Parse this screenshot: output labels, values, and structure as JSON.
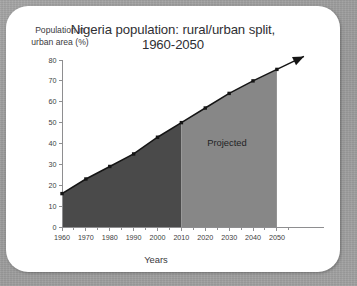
{
  "figure": {
    "title_line1": "Nigeria population: rural/urban split,",
    "title_line2": "1960-2050",
    "ylabel_line1": "Population in",
    "ylabel_line2": "urban area (%)",
    "xlabel": "Years",
    "annotation": "Projected",
    "colors": {
      "page_background": "#9e9e9e",
      "card_background": "#ffffff",
      "historical_fill": "#4a4a4a",
      "projected_fill": "#878787",
      "line": "#151515",
      "axis": "#8e8e90",
      "text": "#37373a"
    }
  },
  "chart_data": {
    "type": "area",
    "title": "Nigeria population: rural/urban split, 1960-2050",
    "xlabel": "Years",
    "ylabel": "Population in urban area (%)",
    "xlim": [
      1960,
      2058
    ],
    "ylim": [
      0,
      80
    ],
    "grid": false,
    "legend": false,
    "annotations": [
      {
        "text": "Projected",
        "x": 2030,
        "y": 40
      }
    ],
    "x": [
      1960,
      1970,
      1980,
      1990,
      2000,
      2010,
      2020,
      2030,
      2040,
      2050
    ],
    "values": [
      16,
      23,
      29,
      35,
      43,
      50,
      57,
      64,
      70,
      75.5
    ],
    "series": [
      {
        "name": "Urban population share (%)",
        "values": [
          16,
          23,
          29,
          35,
          43,
          50,
          57,
          64,
          70,
          75.5
        ]
      }
    ],
    "segments": [
      {
        "name": "Historical",
        "x_start": 1960,
        "x_end": 2010,
        "fill": "#4a4a4a"
      },
      {
        "name": "Projected",
        "x_start": 2010,
        "x_end": 2050,
        "fill": "#878787"
      }
    ],
    "xticks": [
      1960,
      1970,
      1980,
      1990,
      2000,
      2010,
      2020,
      2030,
      2040,
      2050
    ],
    "xtick_labels": [
      "1960",
      "1970",
      "1980",
      "1990",
      "2000",
      "2010",
      "2020",
      "2030",
      "2040",
      "2050"
    ],
    "yticks": [
      0,
      10,
      20,
      30,
      40,
      50,
      60,
      70,
      80
    ],
    "ytick_labels": [
      "0",
      "10",
      "20",
      "30",
      "40",
      "50",
      "60",
      "70",
      "80"
    ]
  }
}
